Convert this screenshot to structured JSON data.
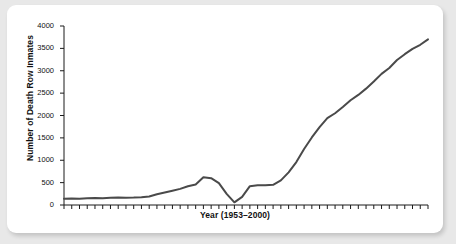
{
  "chart_data": {
    "type": "line",
    "title": "",
    "xlabel": "Year (1953–2000)",
    "ylabel": "Number of Death Row Inmates",
    "ylim": [
      0,
      4000
    ],
    "xlim": [
      1953,
      2000
    ],
    "yticks": [
      0,
      500,
      1000,
      1500,
      2000,
      2500,
      3000,
      3500,
      4000
    ],
    "ytick_labels": [
      "0",
      "500",
      "1000",
      "1500",
      "2000",
      "2500",
      "3000",
      "3500",
      "4000"
    ],
    "xticks_labeled": false,
    "xtick_count": 48,
    "grid": false,
    "legend": false,
    "line_color": "#4a4a4a",
    "line_width": 2,
    "x": [
      1953,
      1954,
      1955,
      1956,
      1957,
      1958,
      1959,
      1960,
      1961,
      1962,
      1963,
      1964,
      1965,
      1966,
      1967,
      1968,
      1969,
      1970,
      1971,
      1972,
      1973,
      1974,
      1975,
      1976,
      1977,
      1978,
      1979,
      1980,
      1981,
      1982,
      1983,
      1984,
      1985,
      1986,
      1987,
      1988,
      1989,
      1990,
      1991,
      1992,
      1993,
      1994,
      1995,
      1996,
      1997,
      1998,
      1999,
      2000
    ],
    "values": [
      140,
      145,
      140,
      150,
      155,
      150,
      160,
      170,
      160,
      165,
      175,
      190,
      240,
      280,
      320,
      360,
      420,
      460,
      620,
      600,
      490,
      250,
      60,
      180,
      420,
      440,
      440,
      450,
      550,
      730,
      960,
      1250,
      1510,
      1740,
      1940,
      2050,
      2190,
      2340,
      2460,
      2600,
      2760,
      2930,
      3060,
      3240,
      3370,
      3490,
      3580,
      3700
    ],
    "series_name": "Death row inmates",
    "annotations": []
  }
}
